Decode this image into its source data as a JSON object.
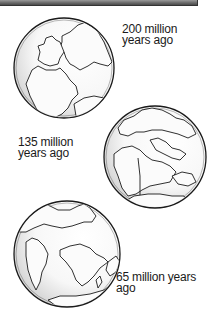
{
  "figure": {
    "type": "continental-drift-illustration",
    "globes": [
      {
        "id": "globe-200",
        "label_line1": "200 million",
        "label_line2": "years ago",
        "center": [
          64,
          68
        ],
        "radius": 50
      },
      {
        "id": "globe-135",
        "label_line1": "135 million",
        "label_line2": "years ago",
        "center": [
          155,
          157
        ],
        "radius": 51
      },
      {
        "id": "globe-65",
        "label_line1": "65 million years",
        "label_line2": "ago",
        "center": [
          67,
          254
        ],
        "radius": 53
      }
    ]
  },
  "colors": {
    "outline": "#1a1a1a",
    "land": "#f4f4f4",
    "shade": "#d8d8d8",
    "topbar": "#6f6f6f"
  }
}
